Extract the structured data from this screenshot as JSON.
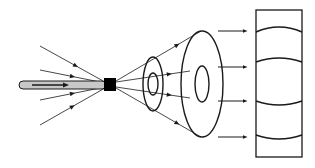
{
  "diagram": {
    "colors": {
      "line": "#1a1a1a",
      "ray": "#333333",
      "rod_fill": "#c8c8c8",
      "block": "#000000",
      "background": "#ffffff"
    },
    "rod": {
      "x1": 19,
      "y": 85,
      "x2": 106,
      "height": 8,
      "inner_arrow": {
        "x1": 32,
        "x2": 66
      }
    },
    "source_block": {
      "x": 104,
      "y": 78,
      "w": 12,
      "h": 13
    },
    "incoming_rays": [
      {
        "from": [
          40,
          46
        ],
        "to": [
          105,
          82
        ],
        "arrow_at": 0.55
      },
      {
        "from": [
          40,
          70
        ],
        "to": [
          105,
          83
        ],
        "arrow_at": 0.5
      },
      {
        "from": [
          40,
          100
        ],
        "to": [
          105,
          87
        ],
        "arrow_at": 0.5
      },
      {
        "from": [
          40,
          125
        ],
        "to": [
          105,
          88
        ],
        "arrow_at": 0.5
      }
    ],
    "outgoing_rays": [
      {
        "from": [
          116,
          81
        ],
        "to": [
          201,
          31
        ]
      },
      {
        "from": [
          116,
          82
        ],
        "to": [
          190,
          71
        ]
      },
      {
        "from": [
          116,
          87
        ],
        "to": [
          190,
          98
        ]
      },
      {
        "from": [
          116,
          88
        ],
        "to": [
          201,
          137
        ]
      }
    ],
    "small_ring": {
      "cx": 153,
      "cy": 84,
      "outer": [
        10,
        27
      ],
      "inner": [
        5,
        11
      ]
    },
    "large_ring": {
      "cx": 202,
      "cy": 84,
      "outer": [
        21,
        53
      ],
      "inner": [
        7,
        18
      ]
    },
    "parallel_arrows": [
      {
        "x1": 218,
        "x2": 245,
        "y": 31
      },
      {
        "x1": 218,
        "x2": 245,
        "y": 67
      },
      {
        "x1": 218,
        "x2": 245,
        "y": 101
      },
      {
        "x1": 218,
        "x2": 245,
        "y": 137
      }
    ],
    "screen": {
      "x": 256,
      "y": 10,
      "w": 46,
      "h": 147,
      "arcs": [
        {
          "y_end": 32,
          "y_mid": 27
        },
        {
          "y_end": 62,
          "y_mid": 58
        },
        {
          "y_end": 101,
          "y_mid": 105
        },
        {
          "y_end": 135,
          "y_mid": 139
        }
      ]
    }
  }
}
